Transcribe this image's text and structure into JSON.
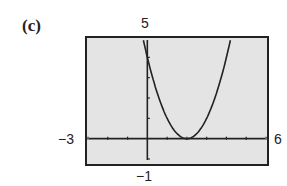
{
  "figure_label": "(c)",
  "window": {
    "xmin_label": "−3",
    "xmax_label": "6",
    "ymax_label": "5",
    "ymin_label": "−1"
  },
  "colors": {
    "screen_bg": "#e4e4e4",
    "frame": "#222222",
    "curve": "#222222"
  },
  "chart_data": {
    "type": "line",
    "title": "(c)",
    "xlabel": "",
    "ylabel": "",
    "xlim": [
      -3,
      6
    ],
    "ylim": [
      -1,
      5
    ],
    "grid": false,
    "x_tick_step": 1,
    "y_tick_step": 1,
    "series": [
      {
        "name": "y = (x - 2)^2",
        "x": [
          -0.2,
          0,
          0.5,
          1,
          1.5,
          2,
          2.5,
          3,
          3.5,
          4,
          4.2
        ],
        "y": [
          4.84,
          4,
          2.25,
          1,
          0.25,
          0,
          0.25,
          1,
          2.25,
          4,
          4.84
        ]
      }
    ],
    "annotations": [
      "5",
      "−1",
      "−3",
      "6"
    ]
  }
}
